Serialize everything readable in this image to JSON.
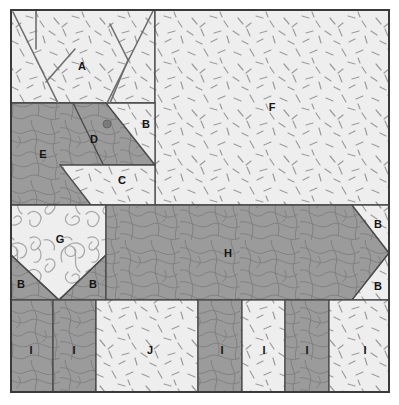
{
  "figure": {
    "type": "site-plan-diagram",
    "title": "",
    "width": 399,
    "height": 405,
    "frame": {
      "x": 11,
      "y": 10,
      "width": 378,
      "height": 382
    }
  },
  "palette": {
    "paper": "#ffffff",
    "light_fill": "#eeeeee",
    "dark_fill": "#9b9b9b",
    "mid_fill": "#d0d0d0",
    "outline": "#4a4a4a",
    "frame_border": "#3a3a3a",
    "label_text": "#151515",
    "marker_dot": "#7b7b7b",
    "hatch_stroke": "#8d8d8d",
    "contour_stroke": "#7d7d7d",
    "scribble_stroke": "#a6a6a6"
  },
  "regions": [
    {
      "id": "A",
      "label": "A",
      "fill": "light_fill",
      "texture": "dashes",
      "label_x": 82,
      "label_y": 66
    },
    {
      "id": "B1",
      "label": "B",
      "fill": "light_fill",
      "texture": "dashes",
      "label_x": 146,
      "label_y": 124
    },
    {
      "id": "C",
      "label": "C",
      "fill": "light_fill",
      "texture": "dashes",
      "label_x": 122,
      "label_y": 180
    },
    {
      "id": "D",
      "label": "D",
      "fill": "dark_fill",
      "texture": "contours",
      "label_x": 94,
      "label_y": 139
    },
    {
      "id": "E",
      "label": "E",
      "fill": "dark_fill",
      "texture": "contours",
      "label_x": 43,
      "label_y": 154
    },
    {
      "id": "F",
      "label": "F",
      "fill": "light_fill",
      "texture": "dashes",
      "label_x": 272,
      "label_y": 107
    },
    {
      "id": "G",
      "label": "G",
      "fill": "light_fill",
      "texture": "scribbles",
      "label_x": 60,
      "label_y": 239
    },
    {
      "id": "B2",
      "label": "B",
      "fill": "dark_fill",
      "texture": "contours",
      "label_x": 21,
      "label_y": 284
    },
    {
      "id": "B3",
      "label": "B",
      "fill": "dark_fill",
      "texture": "contours",
      "label_x": 93,
      "label_y": 284
    },
    {
      "id": "H",
      "label": "H",
      "fill": "dark_fill",
      "texture": "contours",
      "label_x": 228,
      "label_y": 253
    },
    {
      "id": "B4",
      "label": "B",
      "fill": "light_fill",
      "texture": "dashes",
      "label_x": 378,
      "label_y": 224
    },
    {
      "id": "B5",
      "label": "B",
      "fill": "light_fill",
      "texture": "dashes",
      "label_x": 378,
      "label_y": 286
    },
    {
      "id": "I1",
      "label": "I",
      "fill": "dark_fill",
      "texture": "contours",
      "label_x": 31,
      "label_y": 350
    },
    {
      "id": "I2",
      "label": "I",
      "fill": "dark_fill",
      "texture": "contours",
      "label_x": 74,
      "label_y": 350
    },
    {
      "id": "J",
      "label": "J",
      "fill": "light_fill",
      "texture": "dashes",
      "label_x": 150,
      "label_y": 350
    },
    {
      "id": "I3",
      "label": "I",
      "fill": "dark_fill",
      "texture": "contours",
      "label_x": 222,
      "label_y": 350
    },
    {
      "id": "I4",
      "label": "I",
      "fill": "light_fill",
      "texture": "dashes",
      "label_x": 264,
      "label_y": 350
    },
    {
      "id": "I5",
      "label": "I",
      "fill": "dark_fill",
      "texture": "contours",
      "label_x": 307,
      "label_y": 350
    },
    {
      "id": "I6",
      "label": "I",
      "fill": "light_fill",
      "texture": "dashes",
      "label_x": 365,
      "label_y": 350
    }
  ],
  "markers": [
    {
      "name": "point-marker-d",
      "x": 107,
      "y": 124,
      "r": 4
    }
  ],
  "branch_lines": {
    "name": "tree-branch-overlay",
    "count": 6
  }
}
